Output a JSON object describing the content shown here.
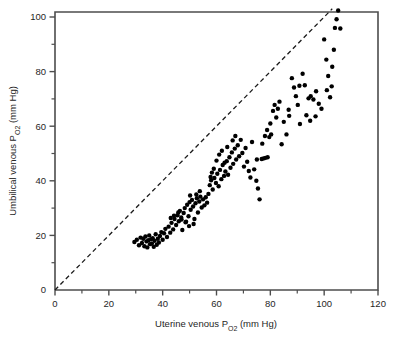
{
  "chart_data": {
    "type": "scatter",
    "title": "",
    "xlabel": "Uterine venous Po2 (mm Hg)",
    "xlabel_main": "Uterine venous P",
    "xlabel_sub": "O",
    "xlabel_sub2": "2",
    "xlabel_tail": " (mm Hg)",
    "ylabel": "Umbilical venous Po2 (mm Hg)",
    "ylabel_main": "Umbilical venous P",
    "ylabel_sub": "O",
    "ylabel_sub2": "2",
    "ylabel_tail": " (mm Hg)",
    "xlim": [
      0,
      120
    ],
    "ylim": [
      0,
      105
    ],
    "xticks": [
      0,
      20,
      40,
      60,
      80,
      100,
      120
    ],
    "xtick_labels": [
      "0",
      "20",
      "40",
      "60",
      "80",
      "100",
      "120"
    ],
    "x_minor_ticks": [
      10,
      30,
      50,
      70,
      90,
      110
    ],
    "yticks": [
      0,
      20,
      40,
      60,
      80,
      100
    ],
    "ytick_labels": [
      "0",
      "20",
      "40",
      "60",
      "80",
      "100"
    ],
    "y_minor_ticks": [
      10,
      30,
      50,
      70,
      90
    ],
    "grid": false,
    "legend": "none",
    "marker": "filled-circle",
    "marker_color": "#000000",
    "marker_size": 4.4,
    "frame_color": "#4d4d4d",
    "reference_line": {
      "name": "line-of-identity",
      "style": "dashed",
      "color": "#1a1a1a",
      "x": [
        0,
        103
      ],
      "y": [
        0,
        103
      ],
      "equation": "y = x"
    },
    "points": [
      [
        29.5,
        17.6
      ],
      [
        30.4,
        18.4
      ],
      [
        31.2,
        16.4
      ],
      [
        31.8,
        19.2
      ],
      [
        32.3,
        17.2
      ],
      [
        32.8,
        18.8
      ],
      [
        33.2,
        16.0
      ],
      [
        33.6,
        19.6
      ],
      [
        34.0,
        17.8
      ],
      [
        34.3,
        15.6
      ],
      [
        34.7,
        18.2
      ],
      [
        35.0,
        20.0
      ],
      [
        35.3,
        16.8
      ],
      [
        35.7,
        18.6
      ],
      [
        36.0,
        17.0
      ],
      [
        36.3,
        19.0
      ],
      [
        36.7,
        15.8
      ],
      [
        37.0,
        18.0
      ],
      [
        37.4,
        20.4
      ],
      [
        37.8,
        16.6
      ],
      [
        38.2,
        18.8
      ],
      [
        38.6,
        17.4
      ],
      [
        39.0,
        19.8
      ],
      [
        39.5,
        21.2
      ],
      [
        40.0,
        18.4
      ],
      [
        40.5,
        20.8
      ],
      [
        41.0,
        22.4
      ],
      [
        41.6,
        19.4
      ],
      [
        42.2,
        23.2
      ],
      [
        42.8,
        21.0
      ],
      [
        43.3,
        24.6
      ],
      [
        43.9,
        22.2
      ],
      [
        44.4,
        26.0
      ],
      [
        45.0,
        23.8
      ],
      [
        45.5,
        27.4
      ],
      [
        46.0,
        25.2
      ],
      [
        46.4,
        29.0
      ],
      [
        46.9,
        26.6
      ],
      [
        47.3,
        22.0
      ],
      [
        47.8,
        28.2
      ],
      [
        48.2,
        30.0
      ],
      [
        48.7,
        25.0
      ],
      [
        49.1,
        31.2
      ],
      [
        49.6,
        27.0
      ],
      [
        50.0,
        32.2
      ],
      [
        50.4,
        29.4
      ],
      [
        50.9,
        33.0
      ],
      [
        51.3,
        30.6
      ],
      [
        51.8,
        26.0
      ],
      [
        52.2,
        31.8
      ],
      [
        52.7,
        33.6
      ],
      [
        53.1,
        28.4
      ],
      [
        53.6,
        32.4
      ],
      [
        54.0,
        34.2
      ],
      [
        54.5,
        30.2
      ],
      [
        55.0,
        33.2
      ],
      [
        55.5,
        31.0
      ],
      [
        56.0,
        34.0
      ],
      [
        56.5,
        32.0
      ],
      [
        57.0,
        35.2
      ],
      [
        51.5,
        24.2
      ],
      [
        49.8,
        23.4
      ],
      [
        48.5,
        24.8
      ],
      [
        47.0,
        25.8
      ],
      [
        45.8,
        28.4
      ],
      [
        44.2,
        27.2
      ],
      [
        43.0,
        26.4
      ],
      [
        52.5,
        35.0
      ],
      [
        53.8,
        36.2
      ],
      [
        50.2,
        34.6
      ],
      [
        57.5,
        38.4
      ],
      [
        58.0,
        40.2
      ],
      [
        58.6,
        36.8
      ],
      [
        59.2,
        41.0
      ],
      [
        59.8,
        39.2
      ],
      [
        60.3,
        42.6
      ],
      [
        60.8,
        38.0
      ],
      [
        61.3,
        44.0
      ],
      [
        61.8,
        40.6
      ],
      [
        62.3,
        45.8
      ],
      [
        62.8,
        41.8
      ],
      [
        63.3,
        43.4
      ],
      [
        63.8,
        47.2
      ],
      [
        64.3,
        42.2
      ],
      [
        64.8,
        48.6
      ],
      [
        65.2,
        44.8
      ],
      [
        65.7,
        50.4
      ],
      [
        66.2,
        46.2
      ],
      [
        66.8,
        51.8
      ],
      [
        67.3,
        47.8
      ],
      [
        67.9,
        53.0
      ],
      [
        68.4,
        49.0
      ],
      [
        69.0,
        55.0
      ],
      [
        69.6,
        50.2
      ],
      [
        70.2,
        45.2
      ],
      [
        60.0,
        47.4
      ],
      [
        61.0,
        49.6
      ],
      [
        62.0,
        51.0
      ],
      [
        63.0,
        46.6
      ],
      [
        64.0,
        52.4
      ],
      [
        66.0,
        54.8
      ],
      [
        67.0,
        56.4
      ],
      [
        58.3,
        43.0
      ],
      [
        59.0,
        44.4
      ],
      [
        57.8,
        41.4
      ],
      [
        70.8,
        52.0
      ],
      [
        71.4,
        47.0
      ],
      [
        72.0,
        43.6
      ],
      [
        72.6,
        41.2
      ],
      [
        73.2,
        54.2
      ],
      [
        74.0,
        44.2
      ],
      [
        74.8,
        40.0
      ],
      [
        75.4,
        37.2
      ],
      [
        76.0,
        33.2
      ],
      [
        75.0,
        47.8
      ],
      [
        76.8,
        48.0
      ],
      [
        77.5,
        48.2
      ],
      [
        78.2,
        48.4
      ],
      [
        79.0,
        48.6
      ],
      [
        77.0,
        53.6
      ],
      [
        78.0,
        56.4
      ],
      [
        78.8,
        58.6
      ],
      [
        79.6,
        56.0
      ],
      [
        80.3,
        57.0
      ],
      [
        81.0,
        65.6
      ],
      [
        81.6,
        67.8
      ],
      [
        82.2,
        63.2
      ],
      [
        82.8,
        66.4
      ],
      [
        80.0,
        61.0
      ],
      [
        83.4,
        69.0
      ],
      [
        84.2,
        53.4
      ],
      [
        85.0,
        61.6
      ],
      [
        86.0,
        57.0
      ],
      [
        87.0,
        63.8
      ],
      [
        88.0,
        77.6
      ],
      [
        88.8,
        74.2
      ],
      [
        89.5,
        71.0
      ],
      [
        90.2,
        67.8
      ],
      [
        91.0,
        60.8
      ],
      [
        92.0,
        79.2
      ],
      [
        92.8,
        75.0
      ],
      [
        93.4,
        64.0
      ],
      [
        94.2,
        70.2
      ],
      [
        95.0,
        71.0
      ],
      [
        96.0,
        69.8
      ],
      [
        97.0,
        72.8
      ],
      [
        98.0,
        68.2
      ],
      [
        99.0,
        66.4
      ],
      [
        100.0,
        91.8
      ],
      [
        100.8,
        84.4
      ],
      [
        101.5,
        78.4
      ],
      [
        102.2,
        70.6
      ],
      [
        103.0,
        81.8
      ],
      [
        104.0,
        96.0
      ],
      [
        104.6,
        99.2
      ],
      [
        105.2,
        102.4
      ],
      [
        106.0,
        95.8
      ],
      [
        103.6,
        88.0
      ],
      [
        102.8,
        74.6
      ],
      [
        101.0,
        73.2
      ],
      [
        96.8,
        63.6
      ],
      [
        94.8,
        62.0
      ],
      [
        90.8,
        74.8
      ],
      [
        86.8,
        66.0
      ]
    ],
    "n_points": 166
  }
}
